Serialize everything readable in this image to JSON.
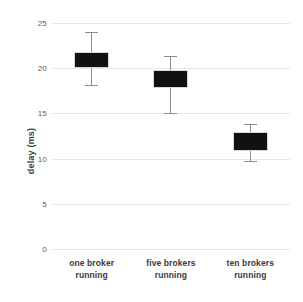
{
  "chart_data": {
    "type": "box",
    "title": "",
    "xlabel": "",
    "ylabel": "delay (ms)",
    "ylim": [
      0,
      25
    ],
    "yticks": [
      0,
      5,
      10,
      15,
      20,
      25
    ],
    "ytick_labels": [
      "0",
      "5",
      "10",
      "15",
      "20",
      "25"
    ],
    "grid": true,
    "legend": "none",
    "categories": [
      "one broker running",
      "five brokers running",
      "ten brokers running"
    ],
    "category_lines": [
      [
        "one broker",
        "running"
      ],
      [
        "five brokers",
        "running"
      ],
      [
        "ten brokers",
        "running"
      ]
    ],
    "boxes": [
      {
        "category": "one broker running",
        "whisker_low": 18.1,
        "box_low": 20.0,
        "box_high": 21.8,
        "whisker_high": 24.0
      },
      {
        "category": "five brokers running",
        "whisker_low": 15.0,
        "box_low": 17.8,
        "box_high": 19.8,
        "whisker_high": 21.4
      },
      {
        "category": "ten brokers running",
        "whisker_low": 9.7,
        "box_low": 10.8,
        "box_high": 12.9,
        "whisker_high": 13.8
      }
    ],
    "colors": {
      "box_fill": "#111111",
      "whisker": "#8d8d8d",
      "gridline": "#e8e8e8",
      "text": "#3b3b3b",
      "tick_text": "#58595b",
      "background": "#ffffff"
    }
  }
}
